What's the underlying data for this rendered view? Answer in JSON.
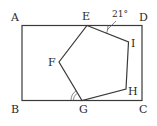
{
  "diagram": {
    "type": "geometry",
    "rectangle": {
      "vertices": [
        "A",
        "B",
        "C",
        "D"
      ]
    },
    "pentagon": {
      "vertices": [
        "E",
        "F",
        "G",
        "H",
        "I"
      ]
    },
    "labels": {
      "A": "A",
      "B": "B",
      "C": "C",
      "D": "D",
      "E": "E",
      "F": "F",
      "G": "G",
      "H": "H",
      "I": "I"
    },
    "angles": {
      "DEI": {
        "label": "21°",
        "at": "E",
        "between": [
          "ED",
          "EI"
        ]
      },
      "BGF": {
        "label": "",
        "at": "G",
        "between": [
          "GB",
          "GF"
        ],
        "marker": "double-arc"
      }
    },
    "colors": {
      "stroke": "#3a3a3a",
      "background": "#ffffff"
    }
  }
}
